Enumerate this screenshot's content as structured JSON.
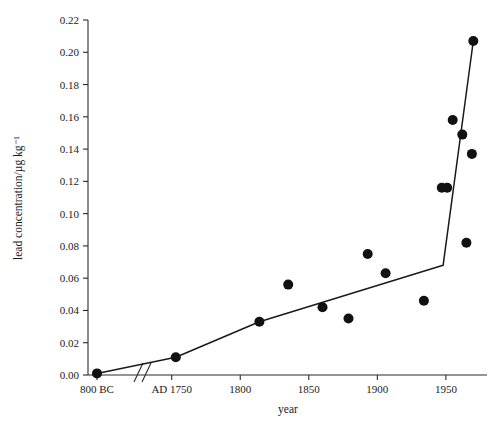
{
  "chart_data": {
    "type": "scatter",
    "title": "",
    "xlabel": "year",
    "ylabel": "lead concentration/µg kg⁻¹",
    "ylim": [
      0.0,
      0.22
    ],
    "ytick_values": [
      0.0,
      0.02,
      0.04,
      0.06,
      0.08,
      0.1,
      0.12,
      0.14,
      0.16,
      0.18,
      0.2,
      0.22
    ],
    "ytick_labels": [
      "0.00",
      "0.02",
      "0.04",
      "0.06",
      "0.08",
      "0.10",
      "0.12",
      "0.14",
      "0.16",
      "0.18",
      "0.20",
      "0.22"
    ],
    "xtick_labels": [
      "800 BC",
      "AD 1750",
      "1800",
      "1850",
      "1900",
      "1950"
    ],
    "xtick_values": [
      -800,
      1750,
      1800,
      1850,
      1900,
      1950
    ],
    "axis_break": {
      "present": true,
      "between": [
        "800 BC",
        "AD 1750"
      ],
      "style": "double-slash"
    },
    "grid": false,
    "legend": null,
    "marker": {
      "shape": "circle",
      "color": "#111111",
      "size": 5
    },
    "points": [
      {
        "x": -800,
        "y": 0.001,
        "label": "800 BC"
      },
      {
        "x": 1753,
        "y": 0.011,
        "label": "AD 1753"
      },
      {
        "x": 1814,
        "y": 0.033,
        "label": "1814"
      },
      {
        "x": 1835,
        "y": 0.056,
        "label": "1835"
      },
      {
        "x": 1860,
        "y": 0.042,
        "label": "1860"
      },
      {
        "x": 1879,
        "y": 0.035,
        "label": "1879"
      },
      {
        "x": 1893,
        "y": 0.075,
        "label": "1893"
      },
      {
        "x": 1906,
        "y": 0.063,
        "label": "1906"
      },
      {
        "x": 1934,
        "y": 0.046,
        "label": "1934"
      },
      {
        "x": 1947,
        "y": 0.116,
        "label": "1947"
      },
      {
        "x": 1951,
        "y": 0.116,
        "label": "1951"
      },
      {
        "x": 1955,
        "y": 0.158,
        "label": "1955"
      },
      {
        "x": 1962,
        "y": 0.149,
        "label": "1962"
      },
      {
        "x": 1965,
        "y": 0.082,
        "label": "1965"
      },
      {
        "x": 1969,
        "y": 0.137,
        "label": "1969"
      },
      {
        "x": 1970,
        "y": 0.207,
        "label": "1970"
      }
    ],
    "trend_line": [
      {
        "x": -800,
        "y": 0.001
      },
      {
        "x": 1753,
        "y": 0.011
      },
      {
        "x": 1814,
        "y": 0.033
      },
      {
        "x": 1948,
        "y": 0.068
      },
      {
        "x": 1970,
        "y": 0.207
      }
    ]
  }
}
